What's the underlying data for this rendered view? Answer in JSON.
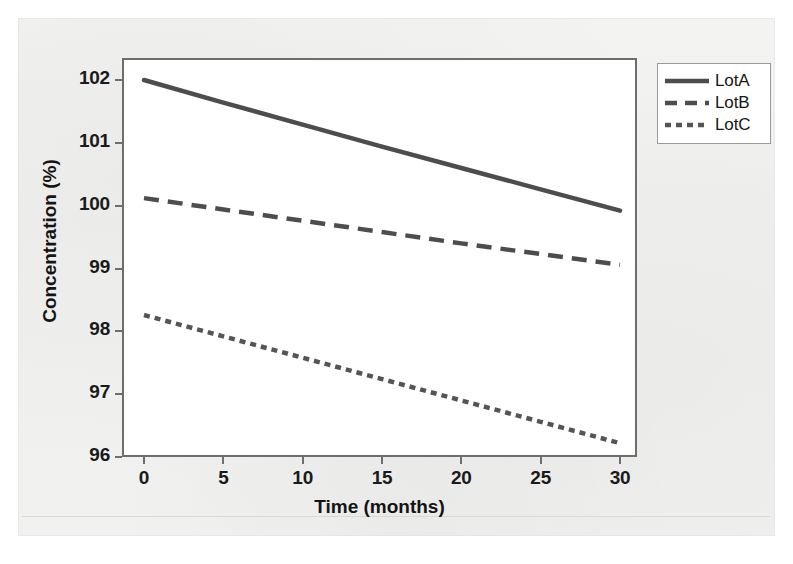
{
  "chart_data": {
    "type": "line",
    "title": "",
    "xlabel": "Time (months)",
    "ylabel": "Concentration (%)",
    "xlim": [
      0,
      30
    ],
    "ylim": [
      96,
      102
    ],
    "xticks": [
      0,
      5,
      10,
      15,
      20,
      25,
      30
    ],
    "yticks": [
      96,
      97,
      98,
      99,
      100,
      101,
      102
    ],
    "xtick_labels": [
      "0",
      "5",
      "10",
      "15",
      "20",
      "25",
      "30"
    ],
    "ytick_labels": [
      "96",
      "97",
      "98",
      "99",
      "100",
      "101",
      "102"
    ],
    "grid": false,
    "legend_position": "upper right outside",
    "x": [
      0,
      5,
      10,
      15,
      20,
      25,
      30
    ],
    "series": [
      {
        "name": "LotA",
        "style": "solid",
        "color": "#4d4d4d",
        "values": [
          102.0,
          101.64,
          101.29,
          100.94,
          100.6,
          100.26,
          99.92
        ]
      },
      {
        "name": "LotB",
        "style": "dashed",
        "color": "#4d4d4d",
        "values": [
          100.12,
          99.94,
          99.76,
          99.58,
          99.4,
          99.23,
          99.06
        ]
      },
      {
        "name": "LotC",
        "style": "dotted",
        "color": "#555555",
        "values": [
          98.26,
          97.92,
          97.58,
          97.24,
          96.9,
          96.56,
          96.22
        ]
      }
    ]
  },
  "legend": {
    "items": [
      {
        "label": "LotA",
        "style": "solid"
      },
      {
        "label": "LotB",
        "style": "dashed"
      },
      {
        "label": "LotC",
        "style": "dotted"
      }
    ]
  },
  "axes": {
    "x_title": "Time (months)",
    "y_title": "Concentration (%)"
  },
  "colors": {
    "line": "#4d4d4d",
    "frame": "#6e6e6e",
    "text": "#141414",
    "plot_background": "#ffffff",
    "paper_background": "#f1f1f0"
  }
}
